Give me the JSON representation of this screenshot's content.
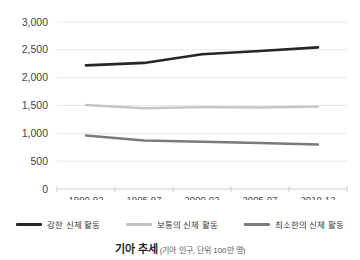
{
  "chart_data": {
    "type": "line",
    "title": "기아 추세",
    "subtitle": "(기아 인구, 단위 100만 명)",
    "xlabel": "",
    "ylabel": "",
    "categories": [
      "1990-92",
      "1995-97",
      "2000-02",
      "2005-07",
      "2010-12"
    ],
    "ylim": [
      0,
      3000
    ],
    "ytick_labels": [
      "0",
      "500",
      "1,000",
      "1,500",
      "2,000",
      "2,500",
      "3,000"
    ],
    "ytick_values": [
      0,
      500,
      1000,
      1500,
      2000,
      2500,
      3000
    ],
    "grid": true,
    "legend_position": "bottom",
    "series": [
      {
        "name": "강한 신체 활동",
        "color": "#262626",
        "values": [
          2220,
          2265,
          2420,
          2480,
          2545
        ]
      },
      {
        "name": "보통의 신체 활동",
        "color": "#c4c4c4",
        "values": [
          1510,
          1450,
          1470,
          1465,
          1480
        ]
      },
      {
        "name": "최소한의 신체 활동",
        "color": "#7a7a7a",
        "values": [
          960,
          870,
          850,
          825,
          800
        ]
      }
    ]
  },
  "legend": {
    "items": [
      {
        "label": "강한 신체 활동",
        "color": "#262626"
      },
      {
        "label": "보통의 신체 활동",
        "color": "#c4c4c4"
      },
      {
        "label": "최소한의 신체 활동",
        "color": "#7a7a7a"
      }
    ]
  },
  "caption": {
    "title": "기아 추세",
    "subtitle": "(기아 인구, 단위 100만 명)"
  }
}
